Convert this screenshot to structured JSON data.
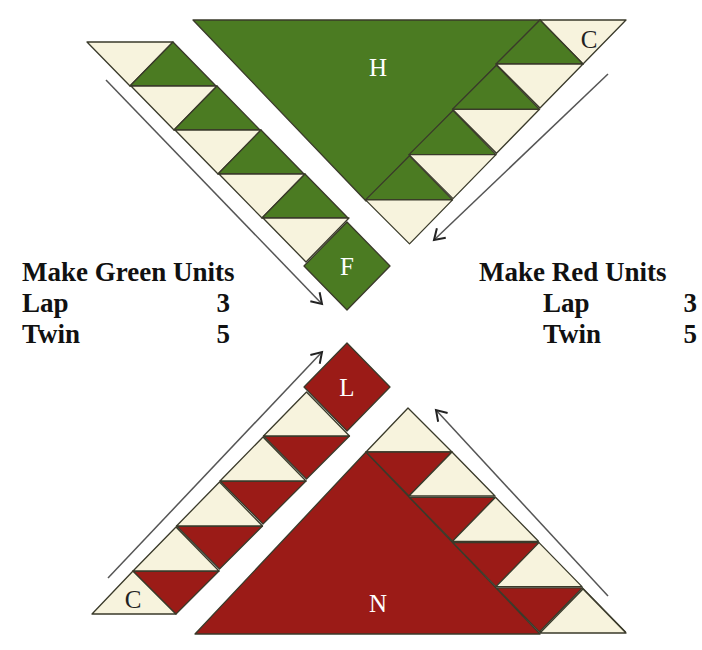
{
  "header": {
    "cropped_text": "sq ta   d  fr  m    p     p"
  },
  "colors": {
    "green": "#4b7b22",
    "red": "#9b1b17",
    "cream": "#f7f3dd",
    "outline": "#3a3a2a",
    "text": "#111111",
    "label_light": "#ffffff",
    "label_dark": "#222222"
  },
  "green_units": {
    "title": "Make Green Units",
    "rows": [
      {
        "label": "Lap",
        "count": "3"
      },
      {
        "label": "Twin",
        "count": "5"
      }
    ]
  },
  "red_units": {
    "title": "Make Red Units",
    "rows": [
      {
        "label": "Lap",
        "count": "3"
      },
      {
        "label": "Twin",
        "count": "5"
      }
    ]
  },
  "pieces": {
    "green_large_triangle": {
      "label": "H",
      "color": "green"
    },
    "green_corner_triangle": {
      "label": "C",
      "color": "cream"
    },
    "green_square": {
      "label": "F",
      "color": "green"
    },
    "red_square": {
      "label": "L",
      "color": "red"
    },
    "red_large_triangle": {
      "label": "N",
      "color": "red"
    },
    "red_corner_triangle": {
      "label": "C",
      "color": "cream"
    }
  },
  "strips": {
    "green_left": {
      "flying_geese_units": 4,
      "direction": "down-right"
    },
    "green_right": {
      "flying_geese_units": 4,
      "direction": "down-left"
    },
    "red_left": {
      "flying_geese_units": 4,
      "direction": "up-right"
    },
    "red_right": {
      "flying_geese_units": 4,
      "direction": "up-left"
    }
  },
  "arrows": [
    {
      "id": "green-left-arrow",
      "from": [
        106,
        80
      ],
      "to": [
        322,
        304
      ]
    },
    {
      "id": "green-right-arrow",
      "from": [
        608,
        74
      ],
      "to": [
        434,
        240
      ]
    },
    {
      "id": "red-left-arrow",
      "from": [
        108,
        578
      ],
      "to": [
        322,
        352
      ]
    },
    {
      "id": "red-right-arrow",
      "from": [
        608,
        596
      ],
      "to": [
        436,
        410
      ]
    }
  ]
}
